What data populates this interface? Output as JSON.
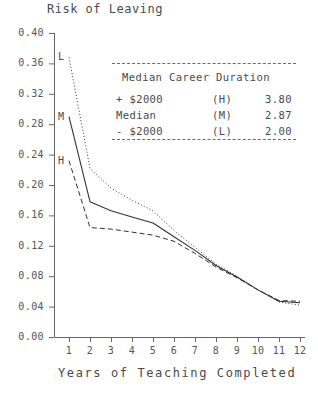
{
  "chart_data": {
    "type": "line",
    "title": "Risk of Leaving",
    "xlabel": "Years of Teaching Completed",
    "ylabel": "Risk of Leaving",
    "xlim": [
      0,
      12
    ],
    "ylim": [
      0.0,
      0.4
    ],
    "grid": false,
    "legend_position": "top-right-inset",
    "x": [
      1,
      2,
      3,
      4,
      5,
      6,
      7,
      8,
      9,
      10,
      11,
      12
    ],
    "ytick_labels": [
      "0.40",
      "0.36",
      "0.32",
      "0.28",
      "0.24",
      "0.20",
      "0.16",
      "0.12",
      "0.08",
      "0.04",
      "0.00"
    ],
    "ytick_values": [
      0.4,
      0.36,
      0.32,
      0.28,
      0.24,
      0.2,
      0.16,
      0.12,
      0.08,
      0.04,
      0.0
    ],
    "xtick_labels": [
      "1",
      "2",
      "3",
      "4",
      "5",
      "6",
      "7",
      "8",
      "9",
      "10",
      "11",
      "12"
    ],
    "series": [
      {
        "name": "L",
        "label": "- $2000",
        "code": "(L)",
        "style": "dotted",
        "marker_label": "L",
        "values": [
          0.368,
          0.222,
          0.196,
          0.18,
          0.166,
          0.14,
          0.118,
          0.096,
          0.08,
          0.062,
          0.046,
          0.042
        ]
      },
      {
        "name": "M",
        "label": "Median",
        "code": "(M)",
        "style": "solid",
        "marker_label": "M",
        "values": [
          0.29,
          0.178,
          0.166,
          0.158,
          0.15,
          0.132,
          0.114,
          0.094,
          0.079,
          0.062,
          0.047,
          0.045
        ]
      },
      {
        "name": "H",
        "label": "+ $2000",
        "code": "(H)",
        "style": "dashed",
        "marker_label": "H",
        "values": [
          0.232,
          0.144,
          0.142,
          0.138,
          0.134,
          0.126,
          0.11,
          0.092,
          0.078,
          0.062,
          0.048,
          0.047
        ]
      }
    ]
  },
  "legend": {
    "heading": "Median Career Duration",
    "rows": [
      {
        "name": "+ $2000",
        "code": "(H)",
        "value": "3.80"
      },
      {
        "name": "Median",
        "code": "(M)",
        "value": "2.87"
      },
      {
        "name": "- $2000",
        "code": "(L)",
        "value": "2.00"
      }
    ]
  },
  "axis_markers": [
    {
      "label": "L"
    },
    {
      "label": "M"
    },
    {
      "label": "H"
    }
  ]
}
